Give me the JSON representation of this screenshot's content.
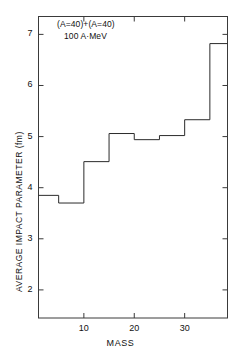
{
  "chart_data": {
    "type": "line",
    "subtype": "step-histogram",
    "title": "",
    "xlabel": "MASS",
    "ylabel": "AVERAGE IMPACT PARAMETER (fm)",
    "xlim": [
      1,
      38.5
    ],
    "ylim": [
      1.45,
      7.35
    ],
    "grid": false,
    "legend": null,
    "xticks": [
      10,
      20,
      30
    ],
    "xtick_labels": [
      "10",
      "20",
      "30"
    ],
    "yticks": [
      2,
      3,
      4,
      5,
      6,
      7
    ],
    "ytick_labels": [
      "2",
      "3",
      "4",
      "5",
      "6",
      "7"
    ],
    "annotations": [
      {
        "text": "(A=40)+(A=40)",
        "x": 6.5,
        "y": 7.05
      },
      {
        "text": "100 A·MeV",
        "x": 8.0,
        "y": 6.8
      }
    ],
    "series": [
      {
        "name": "average impact parameter vs mass",
        "line_color": "#2b2b2b",
        "line_width": 1,
        "step_edges": [
          1,
          5,
          10,
          15,
          20,
          25,
          30,
          35,
          38.5
        ],
        "values": [
          3.85,
          3.7,
          4.51,
          5.06,
          4.94,
          5.02,
          5.33,
          6.82
        ],
        "bin_centers": [
          3,
          7.5,
          12.5,
          17.5,
          22.5,
          27.5,
          32.5,
          36.75
        ]
      }
    ]
  },
  "axes": {
    "frame_color": "#3a3a3a",
    "background": "#ffffff"
  }
}
